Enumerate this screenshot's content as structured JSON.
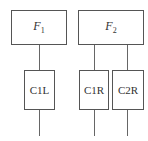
{
  "diagram": {
    "top_nodes": [
      {
        "id": "F1",
        "base": "F",
        "sub": "1"
      },
      {
        "id": "F2",
        "base": "F",
        "sub": "2"
      }
    ],
    "bottom_nodes": [
      {
        "id": "C1L",
        "label": "C1L"
      },
      {
        "id": "C1R",
        "label": "C1R"
      },
      {
        "id": "C2R",
        "label": "C2R"
      }
    ],
    "edges": [
      {
        "from": "F1",
        "to": "C1L"
      },
      {
        "from": "F2",
        "to": "C1R"
      },
      {
        "from": "F2",
        "to": "C2R"
      }
    ]
  }
}
